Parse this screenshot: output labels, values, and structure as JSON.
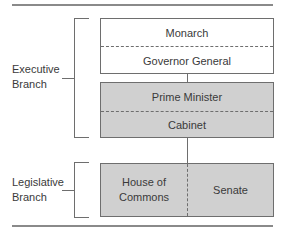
{
  "diagram": {
    "branches": [
      {
        "id": "executive",
        "label_line1": "Executive",
        "label_line2": "Branch"
      },
      {
        "id": "legislative",
        "label_line1": "Legislative",
        "label_line2": "Branch"
      }
    ],
    "executive": {
      "crown_box": {
        "top": "Monarch",
        "bottom": "Governor General"
      },
      "government_box": {
        "top": "Prime Minister",
        "bottom": "Cabinet"
      }
    },
    "legislative": {
      "parliament_box": {
        "left_line1": "House of",
        "left_line2": "Commons",
        "right": "Senate"
      }
    },
    "colors": {
      "grey_fill": "#d0d0d0",
      "line": "#6e6e6e",
      "text": "#3a3a3a"
    }
  }
}
